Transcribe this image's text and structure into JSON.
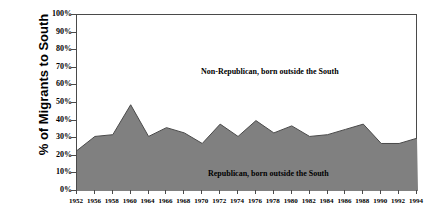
{
  "chart_data": {
    "type": "area",
    "title": "",
    "xlabel": "",
    "ylabel": "% of Migrants to South",
    "ylim": [
      0,
      100
    ],
    "xlim_categories_count": 20,
    "grid": false,
    "legend_position": "inline-annotations",
    "categories": [
      "1952",
      "1956",
      "1958",
      "1960",
      "1964",
      "1966",
      "1968",
      "1970",
      "1972",
      "1974",
      "1976",
      "1978",
      "1980",
      "1982",
      "1984",
      "1986",
      "1988",
      "1990",
      "1992",
      "1994"
    ],
    "series": [
      {
        "name": "Republican, born outside the South",
        "fill_color": "#808080",
        "values": [
          23,
          31,
          32,
          49,
          31,
          36,
          33,
          27,
          38,
          31,
          40,
          33,
          37,
          31,
          32,
          35,
          38,
          27,
          27,
          30
        ]
      },
      {
        "name": "Non-Republican, born outside the South",
        "fill_color": "#ffffff",
        "values": [
          77,
          69,
          68,
          51,
          69,
          64,
          67,
          73,
          62,
          69,
          60,
          67,
          63,
          69,
          68,
          65,
          62,
          73,
          73,
          70
        ]
      }
    ],
    "y_tick_labels": [
      "100%",
      "90%",
      "80%",
      "70%",
      "60%",
      "50%",
      "40%",
      "30%",
      "20%",
      "10%",
      "0%"
    ],
    "y_tick_values": [
      100,
      90,
      80,
      70,
      60,
      50,
      40,
      30,
      20,
      10,
      0
    ],
    "annotations": [
      {
        "id": "upper",
        "text": "Non-Republican, born outside the South"
      },
      {
        "id": "lower",
        "text": "Republican, born outside the South"
      }
    ],
    "colors": {
      "area_fill": "#808080",
      "area_stroke": "#4a4a4a",
      "axis": "#4a4a4a",
      "background": "#ffffff",
      "text": "#000000"
    }
  }
}
